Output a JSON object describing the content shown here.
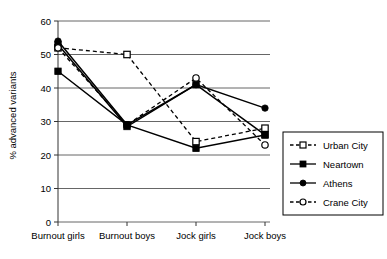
{
  "chart_data": {
    "type": "line",
    "title": "",
    "xlabel": "",
    "ylabel": "% advanced variants",
    "categories": [
      "Burnout girls",
      "Burnout boys",
      "Jock girls",
      "Jock boys"
    ],
    "ylim": [
      0,
      60
    ],
    "yticks": [
      0,
      10,
      20,
      30,
      40,
      50,
      60
    ],
    "ytick_labels": [
      "0",
      "10",
      "20",
      "30",
      "40",
      "50",
      "60"
    ],
    "grid": "horizontal",
    "legend_position": "right",
    "series": [
      {
        "name": "Urban City",
        "values": [
          52,
          50,
          24,
          28
        ],
        "line_style": "dashed",
        "marker": "open-square",
        "color": "#000000"
      },
      {
        "name": "Neartown",
        "values": [
          53,
          28.5,
          41,
          26
        ],
        "line_style": "solid",
        "marker": "filled-square",
        "color": "#000000"
      },
      {
        "name": "Athens",
        "values": [
          54,
          29,
          41,
          34
        ],
        "line_style": "solid",
        "marker": "filled-circle",
        "color": "#000000"
      },
      {
        "name": "Crane City",
        "values": [
          52,
          29,
          43,
          23
        ],
        "line_style": "dashed",
        "marker": "open-circle",
        "color": "#000000"
      }
    ],
    "extra_series": [
      {
        "name": "Neartown-low",
        "values": [
          45,
          29,
          22,
          26
        ],
        "line_style": "solid",
        "marker": "filled-square",
        "color": "#000000"
      }
    ]
  },
  "legend": {
    "entries": [
      {
        "label": "Urban City"
      },
      {
        "label": "Neartown"
      },
      {
        "label": "Athens"
      },
      {
        "label": "Crane City"
      }
    ]
  },
  "axis": {
    "y_title": "% advanced variants"
  }
}
